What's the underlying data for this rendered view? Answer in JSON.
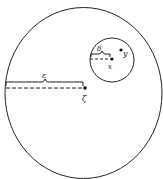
{
  "diagram": {
    "outer_circle": {
      "cx": 83.5,
      "cy": 93,
      "rx": 78.5,
      "ry": 85.5
    },
    "inner_circle": {
      "cx": 112,
      "cy": 60,
      "r": 22
    },
    "labels": {
      "epsilon": "ε",
      "zeta": "ζ",
      "delta": "δ",
      "x": "x",
      "y": "y"
    },
    "stroke_color": "#222222"
  }
}
